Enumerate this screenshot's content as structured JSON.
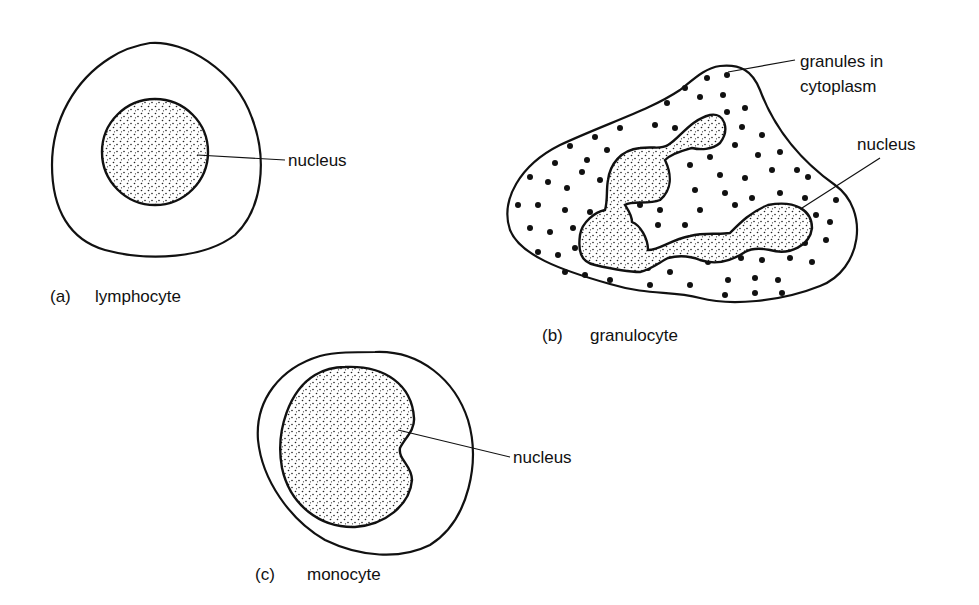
{
  "figure": {
    "panels": [
      {
        "id": "a",
        "tag": "(a)",
        "name": "lymphocyte",
        "labels": [
          "nucleus"
        ]
      },
      {
        "id": "b",
        "tag": "(b)",
        "name": "granulocyte",
        "labels": [
          "granules in",
          "cytoplasm",
          "nucleus"
        ]
      },
      {
        "id": "c",
        "tag": "(c)",
        "name": "monocyte",
        "labels": [
          "nucleus"
        ]
      }
    ],
    "colors": {
      "ink": "#111111",
      "background": "#ffffff"
    }
  }
}
